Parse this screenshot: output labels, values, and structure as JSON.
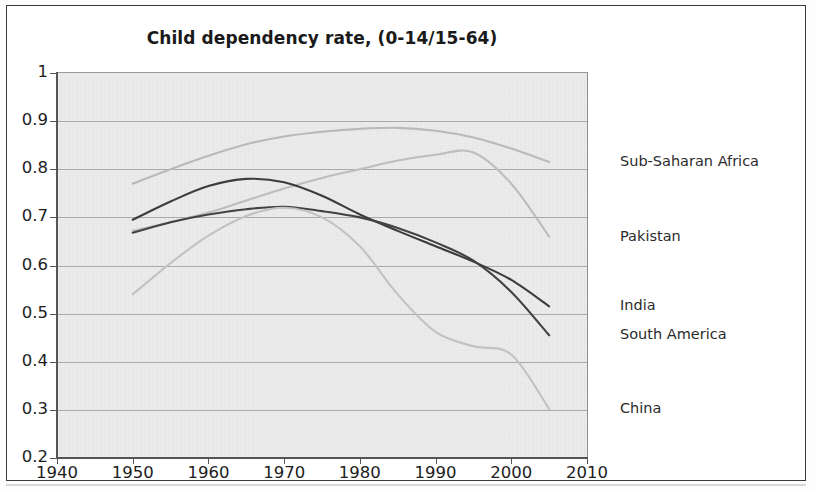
{
  "chart_data": {
    "type": "line",
    "title": "Child dependency rate, (0-14/15-64)",
    "xlabel": "",
    "ylabel": "",
    "xlim": [
      1940,
      2010
    ],
    "ylim": [
      0.2,
      1.0
    ],
    "xticks": [
      1940,
      1950,
      1960,
      1970,
      1980,
      1990,
      2000,
      2010
    ],
    "xtick_labels": [
      "1940",
      "1950",
      "1960",
      "1970",
      "1980",
      "1990",
      "2000",
      "2010"
    ],
    "yticks": [
      0.2,
      0.3,
      0.4,
      0.5,
      0.6,
      0.7,
      0.8,
      0.9,
      1
    ],
    "ytick_labels": [
      "0.2",
      "0.3",
      "0.4",
      "0.5",
      "0.6",
      "0.7",
      "0.8",
      "0.9",
      "1"
    ],
    "grid": "horizontal",
    "legend_position": "right-of-plot-at-line-end",
    "plot_background": "#ececec",
    "x": [
      1950,
      1955,
      1960,
      1965,
      1970,
      1975,
      1980,
      1985,
      1990,
      1995,
      2000,
      2005
    ],
    "series": [
      {
        "name": "Sub-Saharan Africa",
        "color": "#b9b9b9",
        "values": [
          0.77,
          0.8,
          0.828,
          0.852,
          0.868,
          0.878,
          0.884,
          0.886,
          0.88,
          0.866,
          0.843,
          0.815
        ]
      },
      {
        "name": "Pakistan",
        "color": "#bdbdbd",
        "values": [
          0.672,
          0.69,
          0.71,
          0.735,
          0.76,
          0.782,
          0.8,
          0.818,
          0.83,
          0.835,
          0.77,
          0.66
        ]
      },
      {
        "name": "South America",
        "color": "#3c3c3c",
        "values": [
          0.695,
          0.733,
          0.765,
          0.78,
          0.773,
          0.745,
          0.706,
          0.672,
          0.64,
          0.608,
          0.57,
          0.515
        ]
      },
      {
        "name": "India",
        "color": "#424242",
        "values": [
          0.668,
          0.69,
          0.706,
          0.717,
          0.722,
          0.713,
          0.7,
          0.678,
          0.648,
          0.61,
          0.545,
          0.455
        ]
      },
      {
        "name": "China",
        "color": "#c2c2c2",
        "values": [
          0.54,
          0.605,
          0.662,
          0.703,
          0.72,
          0.7,
          0.64,
          0.54,
          0.462,
          0.432,
          0.415,
          0.302
        ]
      }
    ],
    "labels_at_right": [
      {
        "text": "Sub-Saharan Africa",
        "y_value": 0.815
      },
      {
        "text": "Pakistan",
        "y_value": 0.66
      },
      {
        "text": "India",
        "y_value": 0.515
      },
      {
        "text": "South America",
        "y_value": 0.455
      },
      {
        "text": "China",
        "y_value": 0.302
      }
    ]
  }
}
